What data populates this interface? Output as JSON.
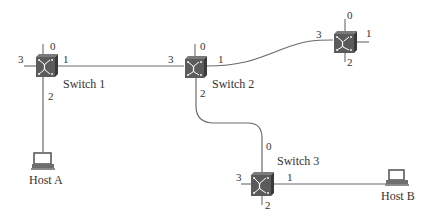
{
  "diagram": {
    "switches": [
      {
        "id": "switch1",
        "label": "Switch 1",
        "ports": [
          "0",
          "1",
          "2",
          "3"
        ]
      },
      {
        "id": "switch2",
        "label": "Switch 2",
        "ports": [
          "0",
          "1",
          "2",
          "3"
        ]
      },
      {
        "id": "switch4",
        "label": "",
        "ports": [
          "0",
          "1",
          "2",
          "3"
        ]
      },
      {
        "id": "switch3",
        "label": "Switch 3",
        "ports": [
          "0",
          "1",
          "2",
          "3"
        ]
      }
    ],
    "hosts": [
      {
        "id": "hostA",
        "label": "Host A"
      },
      {
        "id": "hostB",
        "label": "Host B"
      }
    ],
    "links": [
      {
        "from": "switch1",
        "from_port": "1",
        "to": "switch2",
        "to_port": "3"
      },
      {
        "from": "switch2",
        "from_port": "1",
        "to": "switch4",
        "to_port": "3"
      },
      {
        "from": "switch2",
        "from_port": "2",
        "to": "switch3",
        "to_port": "0"
      },
      {
        "from": "switch1",
        "from_port": "2",
        "to": "hostA",
        "to_port": ""
      },
      {
        "from": "switch3",
        "from_port": "1",
        "to": "hostB",
        "to_port": ""
      }
    ],
    "icons": {
      "switch": "switch-icon",
      "host": "laptop-icon"
    }
  }
}
